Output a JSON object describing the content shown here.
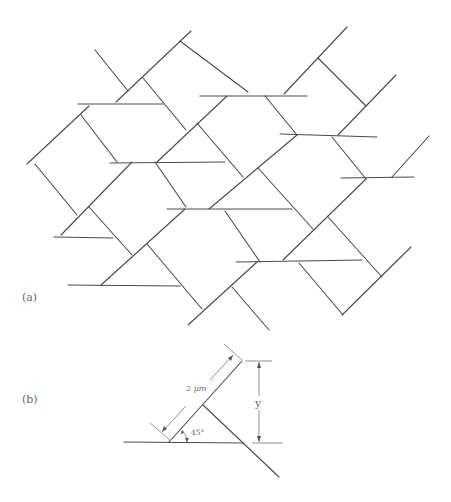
{
  "figure": {
    "panel_a": {
      "label": "(a)",
      "description": "Staggered network of line segments oriented horizontally and at ±45 degrees",
      "segments": [
        [
          95,
          50,
          128,
          91
        ],
        [
          116,
          102,
          191,
          31
        ],
        [
          180,
          41,
          248,
          92
        ],
        [
          78,
          104,
          163,
          104
        ],
        [
          143,
          78,
          186,
          130
        ],
        [
          27,
          164,
          89,
          106
        ],
        [
          81,
          115,
          117,
          162
        ],
        [
          200,
          96,
          307,
          96
        ],
        [
          157,
          162,
          227,
          96
        ],
        [
          265,
          96,
          297,
          135
        ],
        [
          284,
          94,
          347,
          27
        ],
        [
          318,
          58,
          366,
          106
        ],
        [
          338,
          135,
          396,
          75
        ],
        [
          110,
          163,
          225,
          162
        ],
        [
          155,
          162,
          186,
          207
        ],
        [
          61,
          235,
          132,
          162
        ],
        [
          35,
          164,
          77,
          215
        ],
        [
          54,
          237,
          113,
          238
        ],
        [
          89,
          207,
          132,
          255
        ],
        [
          197,
          123,
          243,
          177
        ],
        [
          209,
          209,
          297,
          135
        ],
        [
          167,
          209,
          292,
          209
        ],
        [
          101,
          285,
          185,
          209
        ],
        [
          68,
          285,
          180,
          286
        ],
        [
          147,
          244,
          202,
          309
        ],
        [
          188,
          325,
          257,
          262
        ],
        [
          225,
          211,
          260,
          262
        ],
        [
          258,
          168,
          313,
          229
        ],
        [
          332,
          137,
          366,
          179
        ],
        [
          280,
          134,
          377,
          137
        ],
        [
          341,
          178,
          414,
          177
        ],
        [
          392,
          177,
          429,
          136
        ],
        [
          283,
          260,
          366,
          179
        ],
        [
          236,
          262,
          362,
          260
        ],
        [
          328,
          217,
          382,
          277
        ],
        [
          342,
          315,
          411,
          247
        ],
        [
          299,
          263,
          343,
          315
        ],
        [
          232,
          287,
          269,
          330
        ]
      ]
    },
    "panel_b": {
      "label": "(b)",
      "length_label": "2 μm",
      "angle_label": "45°",
      "height_label": "y"
    }
  }
}
